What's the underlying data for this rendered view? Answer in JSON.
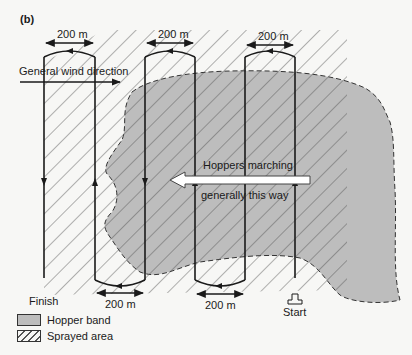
{
  "panel_label": "(b)",
  "distance_labels": {
    "top_left": "200 m",
    "top_middle": "200 m",
    "top_right": "200 m",
    "bottom_left": "200 m",
    "bottom_right": "200 m"
  },
  "wind_label": "General wind direction",
  "hopper_label_line1": "Hoppers marching",
  "hopper_label_line2": "generally this way",
  "finish_label": "Finish",
  "start_label": "Start",
  "legend": {
    "items": [
      {
        "label": "Hopper band",
        "swatch": "gray-fill"
      },
      {
        "label": "Sprayed area",
        "swatch": "hatched"
      }
    ]
  },
  "colors": {
    "hopper_band": "#bdbdbd",
    "hatch": "#555555",
    "background": "#f7f7f5",
    "line": "#1a1a1a"
  }
}
